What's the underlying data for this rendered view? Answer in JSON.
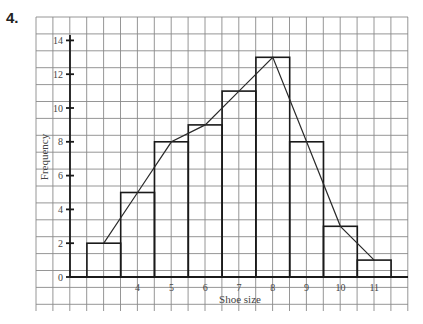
{
  "question_number": "4.",
  "chart_data": {
    "type": "bar",
    "subtype": "histogram_with_frequency_polygon",
    "title": "",
    "xlabel": "Shoe size",
    "ylabel": "Frequency",
    "categories": [
      "3",
      "4",
      "5",
      "6",
      "7",
      "8",
      "9",
      "10",
      "11"
    ],
    "values": [
      2,
      5,
      8,
      9,
      11,
      13,
      8,
      3,
      1
    ],
    "x_tick_labels": [
      "",
      "4",
      "5",
      "6",
      "7",
      "8",
      "9",
      "10",
      "11"
    ],
    "y_tick_labels": [
      "0",
      "2",
      "4",
      "6",
      "8",
      "10",
      "12",
      "14"
    ],
    "ylim": [
      0,
      14
    ],
    "grid": true,
    "legend": "none",
    "frequency_polygon": {
      "points": [
        [
          3,
          2
        ],
        [
          4,
          5
        ],
        [
          5,
          8
        ],
        [
          6,
          9
        ],
        [
          7,
          11
        ],
        [
          8,
          13
        ],
        [
          9,
          8
        ],
        [
          10,
          3
        ],
        [
          11,
          1
        ]
      ]
    }
  }
}
